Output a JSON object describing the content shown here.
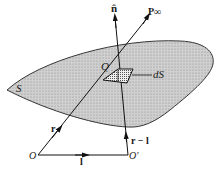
{
  "diagram": {
    "colors": {
      "surface_fill": "#c8c8c8",
      "stroke": "#222222",
      "background": "#ffffff"
    },
    "labels": {
      "surface": "S",
      "point_q": "Q",
      "area_element": "dS",
      "normal": "n̂",
      "far_point": "P∞",
      "position_vector": "r",
      "shifted_vector": "r − l",
      "origin": "O",
      "shifted_origin": "O′",
      "displacement": "l"
    }
  }
}
